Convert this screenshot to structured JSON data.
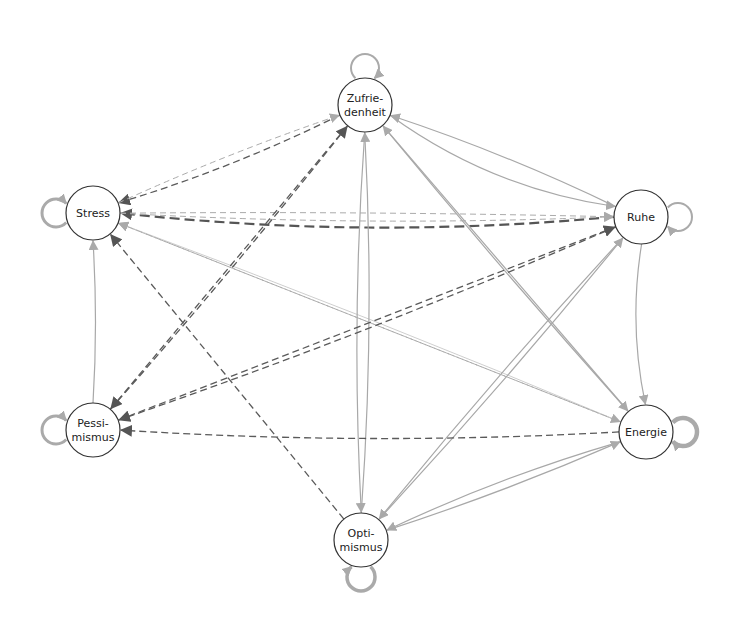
{
  "diagram": {
    "type": "directed-network",
    "nodes": [
      {
        "id": "zufriedenheit",
        "label_lines": [
          "Zufrie-",
          "denheit"
        ],
        "x": 365,
        "y": 105
      },
      {
        "id": "stress",
        "label_lines": [
          "Stress"
        ],
        "x": 93,
        "y": 213
      },
      {
        "id": "ruhe",
        "label_lines": [
          "Ruhe"
        ],
        "x": 641,
        "y": 217
      },
      {
        "id": "pessimismus",
        "label_lines": [
          "Pessi-",
          "mismus"
        ],
        "x": 93,
        "y": 430
      },
      {
        "id": "energie",
        "label_lines": [
          "Energie"
        ],
        "x": 646,
        "y": 432
      },
      {
        "id": "optimismus",
        "label_lines": [
          "Opti-",
          "mismus"
        ],
        "x": 361,
        "y": 540
      }
    ],
    "edge_styles": {
      "positive": {
        "color": "#a8a8a8",
        "dash": "none"
      },
      "negative": {
        "color": "#555555",
        "dash": "7,4"
      },
      "negative_light": {
        "color": "#aaaaaa",
        "dash": "6,4"
      }
    },
    "self_loops": [
      {
        "node": "zufriedenheit",
        "side": "top",
        "width": 2,
        "color": "#aaaaaa"
      },
      {
        "node": "stress",
        "side": "left",
        "width": 3,
        "color": "#aaaaaa"
      },
      {
        "node": "ruhe",
        "side": "right",
        "width": 2,
        "color": "#aaaaaa"
      },
      {
        "node": "pessimismus",
        "side": "left",
        "width": 3,
        "color": "#aaaaaa"
      },
      {
        "node": "energie",
        "side": "right",
        "width": 4.5,
        "color": "#aaaaaa"
      },
      {
        "node": "optimismus",
        "side": "bottom",
        "width": 3.5,
        "color": "#aaaaaa"
      }
    ],
    "edges": [
      {
        "from": "zufriedenheit",
        "to": "ruhe",
        "style": "positive",
        "bend": 30
      },
      {
        "from": "ruhe",
        "to": "zufriedenheit",
        "style": "positive",
        "bend": 8
      },
      {
        "from": "zufriedenheit",
        "to": "stress",
        "style": "negative",
        "bend": -10
      },
      {
        "from": "stress",
        "to": "zufriedenheit",
        "style": "negative_light",
        "bend": -6
      },
      {
        "from": "ruhe",
        "to": "stress",
        "style": "negative",
        "bend": -25
      },
      {
        "from": "stress",
        "to": "ruhe",
        "style": "negative_light",
        "bend": 12
      },
      {
        "from": "stress",
        "to": "ruhe",
        "style": "negative_light",
        "bend": -4
      },
      {
        "from": "pessimismus",
        "to": "stress",
        "style": "positive",
        "bend": 5
      },
      {
        "from": "optimismus",
        "to": "stress",
        "style": "negative",
        "bend": 0
      },
      {
        "from": "energie",
        "to": "stress",
        "style": "negative_light",
        "bend": 0
      },
      {
        "from": "energie",
        "to": "stress",
        "style": "positive_thin",
        "bend": 6
      },
      {
        "from": "pessimismus",
        "to": "zufriedenheit",
        "style": "negative",
        "bend": 5
      },
      {
        "from": "optimismus",
        "to": "zufriedenheit",
        "style": "positive",
        "bend": 12
      },
      {
        "from": "zufriedenheit",
        "to": "optimismus",
        "style": "positive",
        "bend": 12
      },
      {
        "from": "zufriedenheit",
        "to": "energie",
        "style": "positive",
        "bend": 0
      },
      {
        "from": "energie",
        "to": "zufriedenheit",
        "style": "positive",
        "bend": -4
      },
      {
        "from": "ruhe",
        "to": "pessimismus",
        "style": "negative",
        "bend": -10
      },
      {
        "from": "ruhe",
        "to": "energie",
        "style": "positive",
        "bend": 15
      },
      {
        "from": "ruhe",
        "to": "optimismus",
        "style": "positive",
        "bend": 6
      },
      {
        "from": "optimismus",
        "to": "ruhe",
        "style": "positive",
        "bend": 6
      },
      {
        "from": "energie",
        "to": "pessimismus",
        "style": "negative",
        "bend": -15
      },
      {
        "from": "energie",
        "to": "optimismus",
        "style": "positive",
        "bend": 10
      },
      {
        "from": "optimismus",
        "to": "energie",
        "style": "positive",
        "bend": 6
      },
      {
        "from": "zufriedenheit",
        "to": "pessimismus",
        "style": "negative",
        "bend": 0
      },
      {
        "from": "stress",
        "to": "energie",
        "style": "negative_light",
        "bend": 0
      },
      {
        "from": "pessimismus",
        "to": "ruhe",
        "style": "negative",
        "bend": 0
      }
    ]
  }
}
